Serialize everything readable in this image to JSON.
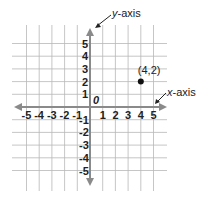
{
  "diagram": {
    "type": "coordinate-plane",
    "x_range": [
      -5,
      5
    ],
    "y_range": [
      -5,
      5
    ],
    "origin_label": "0",
    "x_axis_label": {
      "var": "x",
      "rest": "-axis"
    },
    "y_axis_label": {
      "var": "y",
      "rest": "-axis"
    },
    "x_ticks": [
      "-5",
      "-4",
      "-3",
      "-2",
      "-1",
      "1",
      "2",
      "3",
      "4",
      "5"
    ],
    "y_ticks": [
      "5",
      "4",
      "3",
      "2",
      "1",
      "-1",
      "-2",
      "-3",
      "-4",
      "-5"
    ],
    "points": [
      {
        "x": 4,
        "y": 2,
        "label": "(4,2)"
      }
    ],
    "colors": {
      "grid": "#b8b8b8",
      "axis": "#8a8a8a",
      "text": "#222222",
      "point": "#111111"
    }
  }
}
